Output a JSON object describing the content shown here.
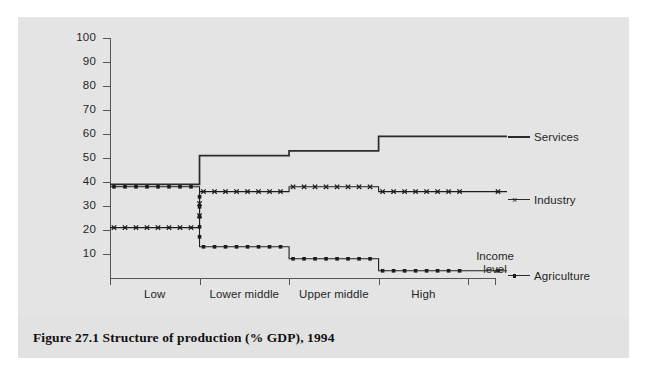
{
  "figure": {
    "caption": "Figure 27.1  Structure of production (% GDP), 1994"
  },
  "chart_data": {
    "type": "line",
    "title": "Structure of production (% GDP), 1994",
    "subtitle": "",
    "xlabel": "Income level",
    "ylabel": "",
    "step": true,
    "grid": false,
    "legend_position": "right",
    "categories": [
      "Low",
      "Lower middle",
      "Upper middle",
      "High"
    ],
    "ylim": [
      0,
      100
    ],
    "yticks": [
      10,
      20,
      30,
      40,
      50,
      60,
      70,
      80,
      90,
      100
    ],
    "ytick_labels": [
      "10",
      "20",
      "30",
      "40",
      "50",
      "60",
      "70",
      "80",
      "90",
      "100"
    ],
    "series": [
      {
        "name": "Services",
        "marker": "none",
        "line": "solid",
        "color": "#2b2b2b",
        "values": [
          39,
          51,
          53,
          59
        ]
      },
      {
        "name": "Industry",
        "marker": "cross",
        "line": "solid",
        "color": "#1c1c1c",
        "values": [
          21,
          36,
          38,
          36
        ]
      },
      {
        "name": "Agriculture",
        "marker": "square",
        "line": "solid",
        "color": "#1c1c1c",
        "values": [
          38,
          13,
          8,
          3
        ]
      }
    ],
    "annotations": [
      "Income level"
    ]
  },
  "axis": {
    "x_title_line1": "Income",
    "x_title_line2": "level"
  },
  "legend": {
    "services": "Services",
    "industry": "Industry",
    "agriculture": "Agriculture"
  }
}
